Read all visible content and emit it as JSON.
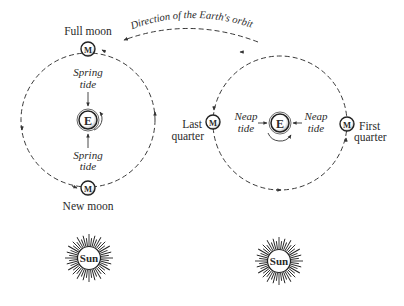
{
  "orbit_label": "Direction of the Earth's orbit",
  "left_panel": {
    "top_moon_label": "Full moon",
    "bottom_moon_label": "New moon",
    "moon_symbol": "M",
    "earth_symbol": "E",
    "top_tide_label_line1": "Spring",
    "top_tide_label_line2": "tide",
    "bottom_tide_label_line1": "Spring",
    "bottom_tide_label_line2": "tide",
    "sun_label": "Sun"
  },
  "right_panel": {
    "left_moon_label_line1": "Last",
    "left_moon_label_line2": "quarter",
    "right_moon_label_line1": "First",
    "right_moon_label_line2": "quarter",
    "moon_symbol": "M",
    "earth_symbol": "E",
    "left_tide_label_line1": "Neap",
    "left_tide_label_line2": "tide",
    "right_tide_label_line1": "Neap",
    "right_tide_label_line2": "tide",
    "sun_label": "Sun"
  },
  "colors": {
    "ink": "#2a2a2a",
    "background": "#ffffff"
  }
}
